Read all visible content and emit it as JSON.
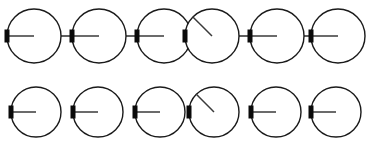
{
  "figure": {
    "background_color": "#ffffff",
    "width": 371,
    "height": 142,
    "stroke_color": "#1a1a1a",
    "marker_color": "#0a0a0a",
    "hand_color": "#3a3a3a",
    "link_color": "#2a2a2a"
  },
  "chart_data": {
    "type": "diagram",
    "xlabel": "",
    "ylabel": "",
    "rows": [
      {
        "name": "top-row",
        "connected": true,
        "center_y": 36,
        "radius": 27,
        "pitch": 65,
        "first_center_x": 34,
        "count": 6,
        "dials": [
          {
            "index": 1,
            "center_x": 34,
            "hand_angle_deg": 0,
            "marker": "left-edge",
            "label": "dial-1"
          },
          {
            "index": 2,
            "center_x": 99,
            "hand_angle_deg": 0,
            "marker": "left-edge",
            "label": "dial-2"
          },
          {
            "index": 3,
            "center_x": 164,
            "hand_angle_deg": 0,
            "marker": "left-edge",
            "label": "dial-3"
          },
          {
            "index": 4,
            "center_x": 212,
            "hand_angle_deg": 135,
            "marker": "left-edge",
            "label": "dial-4"
          },
          {
            "index": 5,
            "center_x": 277,
            "hand_angle_deg": 0,
            "marker": "left-edge",
            "label": "dial-5"
          },
          {
            "index": 6,
            "center_x": 338,
            "hand_angle_deg": 0,
            "marker": "left-edge",
            "label": "dial-6"
          }
        ]
      },
      {
        "name": "bottom-row",
        "connected": false,
        "center_y": 112,
        "radius": 25,
        "pitch": 62,
        "first_center_x": 36,
        "count": 6,
        "dials": [
          {
            "index": 1,
            "center_x": 36,
            "hand_angle_deg": 0,
            "marker": "left-edge",
            "label": "dial-1"
          },
          {
            "index": 2,
            "center_x": 98,
            "hand_angle_deg": 0,
            "marker": "left-edge",
            "label": "dial-2"
          },
          {
            "index": 3,
            "center_x": 160,
            "hand_angle_deg": 0,
            "marker": "left-edge",
            "label": "dial-3"
          },
          {
            "index": 4,
            "center_x": 214,
            "hand_angle_deg": 135,
            "marker": "left-edge",
            "label": "dial-4"
          },
          {
            "index": 5,
            "center_x": 276,
            "hand_angle_deg": 0,
            "marker": "left-edge",
            "label": "dial-5"
          },
          {
            "index": 6,
            "center_x": 336,
            "hand_angle_deg": 0,
            "marker": "left-edge",
            "label": "dial-6"
          }
        ]
      }
    ],
    "notes": {
      "marker_shape": "filled vertical rectangle on left edge of circle",
      "marker_width": 5,
      "marker_height": 13,
      "hand_origin": "left-edge marker",
      "hand_reaches": "circle center",
      "legend_position": "none",
      "grid": false
    }
  }
}
